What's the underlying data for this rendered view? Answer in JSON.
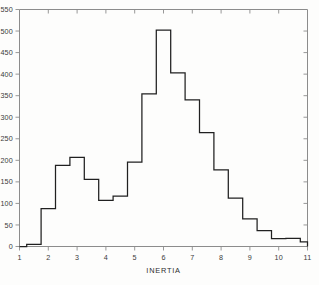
{
  "chart_data": {
    "type": "bar",
    "style": "step-histogram-outline",
    "title": "",
    "subtitle": "",
    "xlabel": "INERTIA",
    "ylabel": "",
    "xlim": [
      1.0,
      11.0
    ],
    "ylim": [
      0,
      550
    ],
    "grid": false,
    "legend": null,
    "bin_width": 0.5,
    "bin_start": 1.25,
    "bin_edges": [
      1.25,
      1.75,
      2.25,
      2.75,
      3.25,
      3.75,
      4.25,
      4.75,
      5.25,
      5.75,
      6.25,
      6.75,
      7.25,
      7.75,
      8.25,
      8.75,
      9.25,
      9.75,
      10.25,
      10.75,
      11.0
    ],
    "bin_centers": [
      1.5,
      2.0,
      2.5,
      3.0,
      3.5,
      4.0,
      4.5,
      5.0,
      5.5,
      6.0,
      6.5,
      7.0,
      7.5,
      8.0,
      8.5,
      9.0,
      9.5,
      10.0,
      10.5,
      10.9
    ],
    "categories": [
      "1.25-1.75",
      "1.75-2.25",
      "2.25-2.75",
      "2.75-3.25",
      "3.25-3.75",
      "3.75-4.25",
      "4.25-4.75",
      "4.75-5.25",
      "5.25-5.75",
      "5.75-6.25",
      "6.25-6.75",
      "6.75-7.25",
      "7.25-7.75",
      "7.75-8.25",
      "8.25-8.75",
      "8.75-9.25",
      "9.25-9.75",
      "9.75-10.25",
      "10.25-10.75",
      "10.75-11.0"
    ],
    "values": [
      5,
      88,
      188,
      207,
      156,
      107,
      117,
      196,
      354,
      502,
      403,
      340,
      264,
      178,
      112,
      64,
      37,
      18,
      19,
      11
    ],
    "x_ticks": [
      1,
      2,
      3,
      4,
      5,
      6,
      7,
      8,
      9,
      10,
      11
    ],
    "x_tick_labels": [
      "1",
      "2",
      "3",
      "4",
      "5",
      "6",
      "7",
      "8",
      "9",
      "10",
      "11"
    ],
    "y_ticks": [
      0,
      50,
      100,
      150,
      200,
      250,
      300,
      350,
      400,
      450,
      500,
      550
    ],
    "y_tick_labels": [
      "0",
      "50",
      "100",
      "150",
      "200",
      "250",
      "300",
      "350",
      "400",
      "450",
      "500",
      "550"
    ],
    "x_minor_ticks": [
      1.5,
      2.5,
      3.5,
      4.5,
      5.5,
      6.5,
      7.5,
      8.5,
      9.5,
      10.5
    ],
    "colors": {
      "line": "#202020",
      "frame": "#8c8c8c",
      "text": "#3a3a3a",
      "background": "#fdfdfc"
    },
    "peak": {
      "x": 6.0,
      "value": 502
    },
    "secondary_peak": {
      "x": 3.0,
      "value": 207
    }
  }
}
